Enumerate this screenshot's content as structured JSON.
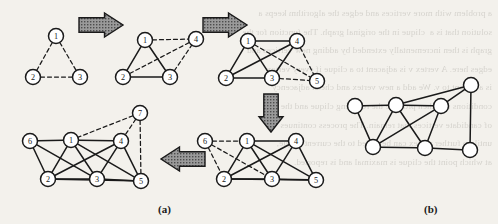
{
  "figure": {
    "captions": {
      "panel_a": "(a)",
      "panel_b": "(b)"
    },
    "style": {
      "background_color": "#f3f1ec",
      "ink_color": "#1a1a1a",
      "node_fill": "#ffffff",
      "arrow_fill": "#8c8c8c",
      "arrow_stroke": "#1a1a1a",
      "solid_edge_color": "#1a1a1a",
      "dashed_edge_color": "#1a1a1a"
    }
  },
  "ghost_text": "a problem with more vertices and edges the algorithm keeps a\nsolution that is a  clique in the original graph. The function for the\ngraph is then incrementally extended by adding new vertices and\nedges here. A vertex v is adjacent to a clique if every vertex\nis adjacent to v. We add a new vertex and check adjacency\nconditions and then produce the resulting clique and the set\nof candidate vertices that remain. The process continues\nuntil no further vertex can be added to the current clique,\nat which point the clique is maximal and is reported.",
  "panels": {
    "a": {
      "label": "(a)",
      "steps": [
        {
          "id": "step-1",
          "nodes": [
            {
              "id": "1",
              "label": "1",
              "cx": 56,
              "cy": 36,
              "state": "new"
            },
            {
              "id": "2",
              "label": "2",
              "cx": 33,
              "cy": 77,
              "state": "new"
            },
            {
              "id": "3",
              "label": "3",
              "cx": 80,
              "cy": 77,
              "state": "new"
            }
          ],
          "edges": [
            {
              "from": "1",
              "to": "2",
              "style": "dashed"
            },
            {
              "from": "1",
              "to": "3",
              "style": "dashed"
            },
            {
              "from": "2",
              "to": "3",
              "style": "dashed"
            }
          ]
        },
        {
          "id": "step-2",
          "nodes": [
            {
              "id": "1",
              "label": "1",
              "cx": 145,
              "cy": 40,
              "state": "fixed"
            },
            {
              "id": "2",
              "label": "2",
              "cx": 123,
              "cy": 77,
              "state": "fixed"
            },
            {
              "id": "3",
              "label": "3",
              "cx": 170,
              "cy": 77,
              "state": "fixed"
            },
            {
              "id": "4",
              "label": "4",
              "cx": 196,
              "cy": 39,
              "state": "new"
            }
          ],
          "edges": [
            {
              "from": "1",
              "to": "2",
              "style": "solid"
            },
            {
              "from": "1",
              "to": "3",
              "style": "solid"
            },
            {
              "from": "2",
              "to": "3",
              "style": "solid"
            },
            {
              "from": "1",
              "to": "4",
              "style": "dashed"
            },
            {
              "from": "2",
              "to": "4",
              "style": "dashed"
            },
            {
              "from": "3",
              "to": "4",
              "style": "dashed"
            }
          ]
        },
        {
          "id": "step-3",
          "nodes": [
            {
              "id": "1",
              "label": "1",
              "cx": 248,
              "cy": 41,
              "state": "fixed"
            },
            {
              "id": "2",
              "label": "2",
              "cx": 226,
              "cy": 78,
              "state": "fixed"
            },
            {
              "id": "3",
              "label": "3",
              "cx": 272,
              "cy": 78,
              "state": "fixed"
            },
            {
              "id": "4",
              "label": "4",
              "cx": 297,
              "cy": 41,
              "state": "fixed"
            },
            {
              "id": "5",
              "label": "5",
              "cx": 317,
              "cy": 81,
              "state": "new"
            }
          ],
          "edges": [
            {
              "from": "1",
              "to": "2",
              "style": "solid"
            },
            {
              "from": "1",
              "to": "3",
              "style": "solid"
            },
            {
              "from": "2",
              "to": "3",
              "style": "solid"
            },
            {
              "from": "1",
              "to": "4",
              "style": "solid"
            },
            {
              "from": "2",
              "to": "4",
              "style": "solid"
            },
            {
              "from": "3",
              "to": "4",
              "style": "solid"
            },
            {
              "from": "3",
              "to": "5",
              "style": "dashed"
            },
            {
              "from": "4",
              "to": "5",
              "style": "dashed"
            },
            {
              "from": "1",
              "to": "5",
              "style": "dashed"
            }
          ]
        },
        {
          "id": "step-4",
          "nodes": [
            {
              "id": "6",
              "label": "6",
              "cx": 205,
              "cy": 141,
              "state": "new"
            },
            {
              "id": "1",
              "label": "1",
              "cx": 247,
              "cy": 141,
              "state": "fixed"
            },
            {
              "id": "4",
              "label": "4",
              "cx": 296,
              "cy": 141,
              "state": "fixed"
            },
            {
              "id": "2",
              "label": "2",
              "cx": 224,
              "cy": 179,
              "state": "fixed"
            },
            {
              "id": "3",
              "label": "3",
              "cx": 272,
              "cy": 179,
              "state": "fixed"
            },
            {
              "id": "5",
              "label": "5",
              "cx": 316,
              "cy": 180,
              "state": "fixed"
            }
          ],
          "edges": [
            {
              "from": "1",
              "to": "4",
              "style": "solid"
            },
            {
              "from": "1",
              "to": "2",
              "style": "solid"
            },
            {
              "from": "1",
              "to": "3",
              "style": "solid"
            },
            {
              "from": "1",
              "to": "5",
              "style": "solid"
            },
            {
              "from": "2",
              "to": "3",
              "style": "solid"
            },
            {
              "from": "2",
              "to": "4",
              "style": "solid"
            },
            {
              "from": "3",
              "to": "4",
              "style": "solid"
            },
            {
              "from": "3",
              "to": "5",
              "style": "solid"
            },
            {
              "from": "4",
              "to": "5",
              "style": "solid"
            },
            {
              "from": "2",
              "to": "5",
              "style": "solid"
            },
            {
              "from": "6",
              "to": "1",
              "style": "dashed"
            },
            {
              "from": "6",
              "to": "2",
              "style": "dashed"
            },
            {
              "from": "6",
              "to": "3",
              "style": "dashed"
            }
          ]
        },
        {
          "id": "step-5",
          "nodes": [
            {
              "id": "6",
              "label": "6",
              "cx": 30,
              "cy": 141,
              "state": "fixed"
            },
            {
              "id": "1",
              "label": "1",
              "cx": 71,
              "cy": 140,
              "state": "fixed"
            },
            {
              "id": "4",
              "label": "4",
              "cx": 121,
              "cy": 141,
              "state": "fixed"
            },
            {
              "id": "7",
              "label": "7",
              "cx": 140,
              "cy": 113,
              "state": "new"
            },
            {
              "id": "2",
              "label": "2",
              "cx": 48,
              "cy": 179,
              "state": "fixed"
            },
            {
              "id": "3",
              "label": "3",
              "cx": 97,
              "cy": 179,
              "state": "fixed"
            },
            {
              "id": "5",
              "label": "5",
              "cx": 141,
              "cy": 181,
              "state": "fixed"
            }
          ],
          "edges": [
            {
              "from": "6",
              "to": "1",
              "style": "solid"
            },
            {
              "from": "6",
              "to": "2",
              "style": "solid"
            },
            {
              "from": "6",
              "to": "3",
              "style": "solid"
            },
            {
              "from": "1",
              "to": "4",
              "style": "solid"
            },
            {
              "from": "1",
              "to": "2",
              "style": "solid"
            },
            {
              "from": "1",
              "to": "3",
              "style": "solid"
            },
            {
              "from": "1",
              "to": "5",
              "style": "solid"
            },
            {
              "from": "2",
              "to": "3",
              "style": "solid"
            },
            {
              "from": "2",
              "to": "4",
              "style": "solid"
            },
            {
              "from": "2",
              "to": "5",
              "style": "solid"
            },
            {
              "from": "3",
              "to": "4",
              "style": "solid"
            },
            {
              "from": "3",
              "to": "5",
              "style": "solid"
            },
            {
              "from": "4",
              "to": "5",
              "style": "solid"
            },
            {
              "from": "7",
              "to": "1",
              "style": "dashed"
            },
            {
              "from": "7",
              "to": "4",
              "style": "dashed"
            },
            {
              "from": "7",
              "to": "5",
              "style": "dashed"
            }
          ]
        }
      ],
      "arrows": [
        {
          "id": "arrow-1",
          "direction": "right",
          "x": 79,
          "y": 13,
          "w": 44,
          "h": 24
        },
        {
          "id": "arrow-2",
          "direction": "right",
          "x": 203,
          "y": 13,
          "w": 44,
          "h": 24
        },
        {
          "id": "arrow-3",
          "direction": "down",
          "x": 259,
          "y": 94,
          "w": 24,
          "h": 38
        },
        {
          "id": "arrow-4",
          "direction": "left",
          "x": 161,
          "y": 147,
          "w": 44,
          "h": 24
        }
      ]
    },
    "b": {
      "label": "(b)",
      "graph": {
        "nodes": [
          {
            "id": "n1",
            "cx": 471,
            "cy": 85
          },
          {
            "id": "n2",
            "cx": 396,
            "cy": 105
          },
          {
            "id": "n3",
            "cx": 441,
            "cy": 106
          },
          {
            "id": "n4",
            "cx": 355,
            "cy": 106
          },
          {
            "id": "n5",
            "cx": 373,
            "cy": 147
          },
          {
            "id": "n6",
            "cx": 425,
            "cy": 148
          },
          {
            "id": "n7",
            "cx": 470,
            "cy": 150
          }
        ],
        "edges": [
          {
            "from": "n4",
            "to": "n2",
            "style": "solid"
          },
          {
            "from": "n4",
            "to": "n5",
            "style": "solid"
          },
          {
            "from": "n2",
            "to": "n3",
            "style": "solid"
          },
          {
            "from": "n2",
            "to": "n1",
            "style": "solid"
          },
          {
            "from": "n2",
            "to": "n5",
            "style": "solid"
          },
          {
            "from": "n2",
            "to": "n6",
            "style": "solid"
          },
          {
            "from": "n3",
            "to": "n1",
            "style": "solid"
          },
          {
            "from": "n3",
            "to": "n5",
            "style": "solid"
          },
          {
            "from": "n3",
            "to": "n6",
            "style": "solid"
          },
          {
            "from": "n5",
            "to": "n6",
            "style": "solid"
          },
          {
            "from": "n6",
            "to": "n7",
            "style": "solid"
          },
          {
            "from": "n1",
            "to": "n7",
            "style": "solid"
          }
        ]
      }
    }
  }
}
